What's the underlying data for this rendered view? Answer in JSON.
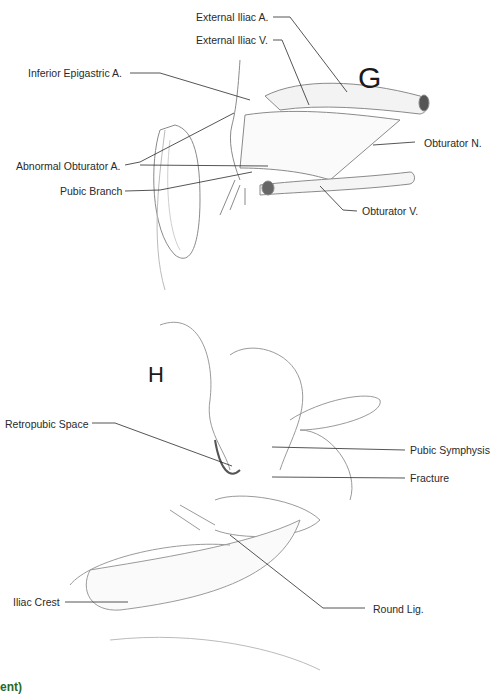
{
  "panels": [
    {
      "letter": "G",
      "labels": {
        "ext_iliac_a": "External Iliac A.",
        "ext_iliac_v": "External Iliac V.",
        "inf_epigastric": "Inferior Epigastric A.",
        "obturator_n": "Obturator N.",
        "abnormal_obturator": "Abnormal Obturator A.",
        "pubic_branch": "Pubic Branch",
        "obturator_v": "Obturator V."
      }
    },
    {
      "letter": "H",
      "labels": {
        "retropubic": "Retropubic Space",
        "pubic_symphysis": "Pubic Symphysis",
        "fracture": "Fracture",
        "iliac_crest": "Iliac Crest",
        "round_lig": "Round Lig."
      }
    }
  ],
  "footer_fragment": "ent)",
  "colors": {
    "line": "#2a2a2a",
    "sketch": "#8a8a8a",
    "fragment": "#1f6b2a"
  }
}
